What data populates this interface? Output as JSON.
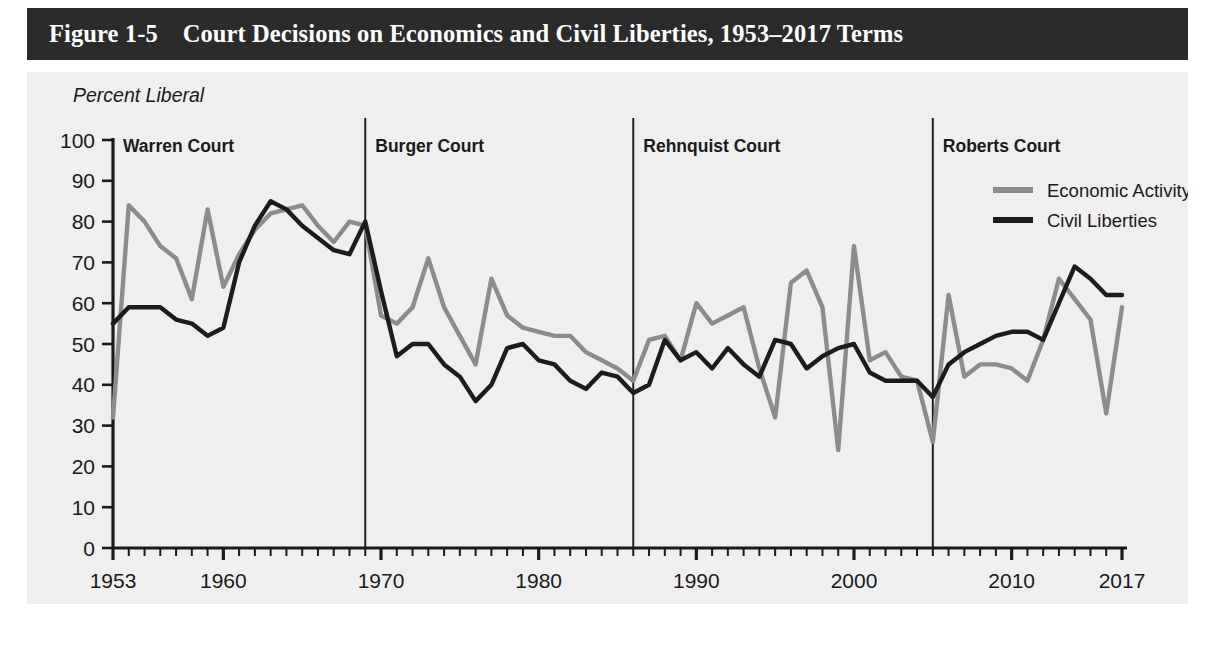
{
  "figure": {
    "title": "Figure 1-5    Court Decisions on Economics and Civil Liberties, 1953–2017 Terms",
    "title_bar_color": "#2b2b2b",
    "panel_color": "#efefef"
  },
  "chart_data": {
    "type": "line",
    "title": "Court Decisions on Economics and Civil Liberties, 1953–2017 Terms",
    "xlabel": "Term",
    "ylabel": "Percent Liberal",
    "xlim": [
      1953,
      2017
    ],
    "ylim": [
      0,
      100
    ],
    "grid": false,
    "legend_position": "top-right",
    "ytick_labels": [
      "0",
      "10",
      "20",
      "30",
      "40",
      "50",
      "60",
      "70",
      "80",
      "90",
      "100"
    ],
    "ytick_values": [
      0,
      10,
      20,
      30,
      40,
      50,
      60,
      70,
      80,
      90,
      100
    ],
    "xtick_labels": [
      "1953",
      "1960",
      "1970",
      "1980",
      "1990",
      "2000",
      "2010",
      "2017"
    ],
    "xtick_values": [
      1953,
      1960,
      1970,
      1980,
      1990,
      2000,
      2010,
      2017
    ],
    "x": [
      1953,
      1954,
      1955,
      1956,
      1957,
      1958,
      1959,
      1960,
      1961,
      1962,
      1963,
      1964,
      1965,
      1966,
      1967,
      1968,
      1969,
      1970,
      1971,
      1972,
      1973,
      1974,
      1975,
      1976,
      1977,
      1978,
      1979,
      1980,
      1981,
      1982,
      1983,
      1984,
      1985,
      1986,
      1987,
      1988,
      1989,
      1990,
      1991,
      1992,
      1993,
      1994,
      1995,
      1996,
      1997,
      1998,
      1999,
      2000,
      2001,
      2002,
      2003,
      2004,
      2005,
      2006,
      2007,
      2008,
      2009,
      2010,
      2011,
      2012,
      2013,
      2014,
      2015,
      2016,
      2017
    ],
    "series": [
      {
        "name": "Economic Activity",
        "color": "#8c8c8c",
        "values": [
          32,
          84,
          80,
          74,
          71,
          61,
          83,
          64,
          72,
          78,
          82,
          83,
          84,
          79,
          75,
          80,
          79,
          57,
          55,
          59,
          71,
          59,
          52,
          45,
          66,
          57,
          54,
          53,
          52,
          52,
          48,
          46,
          44,
          41,
          51,
          52,
          46,
          60,
          55,
          57,
          59,
          44,
          32,
          65,
          68,
          59,
          24,
          74,
          46,
          48,
          42,
          41,
          26,
          62,
          42,
          45,
          45,
          44,
          41,
          51,
          66,
          61,
          56,
          33,
          59
        ]
      },
      {
        "name": "Civil Liberties",
        "color": "#1c1c1c",
        "values": [
          55,
          59,
          59,
          59,
          56,
          55,
          52,
          54,
          70,
          79,
          85,
          83,
          79,
          76,
          73,
          72,
          80,
          63,
          47,
          50,
          50,
          45,
          42,
          36,
          40,
          49,
          50,
          46,
          45,
          41,
          39,
          43,
          42,
          38,
          40,
          51,
          46,
          48,
          44,
          49,
          45,
          42,
          51,
          50,
          44,
          47,
          49,
          50,
          43,
          41,
          41,
          41,
          37,
          45,
          48,
          50,
          52,
          53,
          53,
          51,
          60,
          69,
          66,
          62,
          62
        ]
      }
    ],
    "annotations": [
      {
        "label": "Warren Court",
        "start": 1953,
        "end": 1969
      },
      {
        "label": "Burger Court",
        "start": 1969,
        "end": 1986
      },
      {
        "label": "Rehnquist Court",
        "start": 1986,
        "end": 2005
      },
      {
        "label": "Roberts Court",
        "start": 2005,
        "end": 2017
      }
    ]
  }
}
